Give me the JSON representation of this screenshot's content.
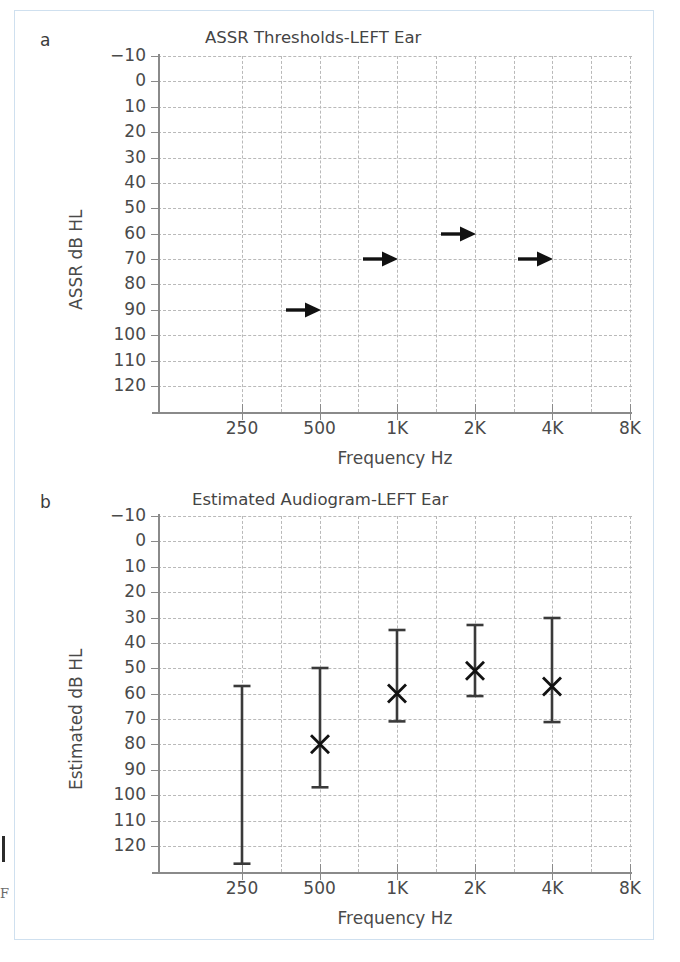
{
  "figure": {
    "margin_note": "F",
    "panels": [
      {
        "letter": "a"
      },
      {
        "letter": "b"
      }
    ]
  },
  "chart_data": [
    {
      "type": "scatter",
      "panel": "a",
      "title": "ASSR Thresholds-LEFT Ear",
      "xlabel": "Frequency Hz",
      "ylabel": "ASSR dB HL",
      "grid": true,
      "legend": "none",
      "y_inverted": true,
      "ylim": [
        -10,
        120
      ],
      "yticks": [
        -10,
        0,
        10,
        20,
        30,
        40,
        50,
        60,
        70,
        80,
        90,
        100,
        110,
        120
      ],
      "ytick_labels": [
        "−10",
        "0",
        "10",
        "20",
        "30",
        "40",
        "50",
        "60",
        "70",
        "80",
        "90",
        "100",
        "110",
        "120"
      ],
      "xticks": [
        250,
        500,
        1000,
        2000,
        4000,
        8000
      ],
      "xtick_labels": [
        "250",
        "500",
        "1K",
        "2K",
        "4K",
        "8K"
      ],
      "marker": "right-arrow (no response / vibrotactile)",
      "points": [
        {
          "x": 500,
          "x_label": "500",
          "y": 90
        },
        {
          "x": 1000,
          "x_label": "1K",
          "y": 70
        },
        {
          "x": 2000,
          "x_label": "2K",
          "y": 60
        },
        {
          "x": 4000,
          "x_label": "4K",
          "y": 70
        }
      ]
    },
    {
      "type": "scatter",
      "panel": "b",
      "title": "Estimated Audiogram-LEFT Ear",
      "xlabel": "Frequency Hz",
      "ylabel": "Estimated dB HL",
      "grid": true,
      "legend": "none",
      "y_inverted": true,
      "ylim": [
        -10,
        120
      ],
      "yticks": [
        -10,
        0,
        10,
        20,
        30,
        40,
        50,
        60,
        70,
        80,
        90,
        100,
        110,
        120
      ],
      "ytick_labels": [
        "−10",
        "0",
        "10",
        "20",
        "30",
        "40",
        "50",
        "60",
        "70",
        "80",
        "90",
        "100",
        "110",
        "120"
      ],
      "xticks": [
        250,
        500,
        1000,
        2000,
        4000,
        8000
      ],
      "xtick_labels": [
        "250",
        "500",
        "1K",
        "2K",
        "4K",
        "8K"
      ],
      "marker": "x with vertical error bars",
      "points": [
        {
          "x": 250,
          "x_label": "250",
          "y": null,
          "err_low": 57,
          "err_high": 127
        },
        {
          "x": 500,
          "x_label": "500",
          "y": 80,
          "err_low": 50,
          "err_high": 97
        },
        {
          "x": 1000,
          "x_label": "1K",
          "y": 60,
          "err_low": 35,
          "err_high": 71
        },
        {
          "x": 2000,
          "x_label": "2K",
          "y": 51,
          "err_low": 33,
          "err_high": 61
        },
        {
          "x": 4000,
          "x_label": "4K",
          "y": 57,
          "err_low": 30,
          "err_high": 71
        }
      ]
    }
  ]
}
